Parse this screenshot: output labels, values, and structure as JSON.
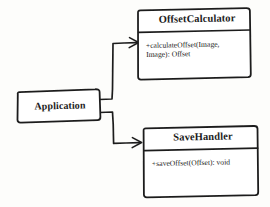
{
  "diagram": {
    "type": "uml-class-diagram",
    "style": "hand-drawn-sketch",
    "background_color": "#fdfdfb",
    "ink_color": "#1f1f1f",
    "classes": [
      {
        "id": "application",
        "name": "Application",
        "compartments": 1,
        "members": []
      },
      {
        "id": "offset_calculator",
        "name": "OffsetCalculator",
        "compartments": 2,
        "members": [
          "+calculateOffset(Image,",
          "Image): Offset"
        ],
        "members_full": "+calculateOffset(Image, Image): Offset"
      },
      {
        "id": "save_handler",
        "name": "SaveHandler",
        "compartments": 2,
        "members": [
          "+saveOffset(Offset): void"
        ],
        "members_full": "+saveOffset(Offset): void"
      }
    ],
    "connectors": [
      {
        "id": "app-to-offsetcalculator",
        "from": "application",
        "to": "offset_calculator",
        "routing": "orthogonal-elbow",
        "arrowhead": "open"
      },
      {
        "id": "app-to-savehandler",
        "from": "application",
        "to": "save_handler",
        "routing": "orthogonal-elbow",
        "arrowhead": "open"
      }
    ]
  }
}
